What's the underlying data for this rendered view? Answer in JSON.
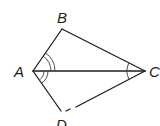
{
  "figure": {
    "type": "kite",
    "vertices": {
      "A": {
        "label": "A",
        "x": 33,
        "y": 71
      },
      "B": {
        "label": "B",
        "x": 62,
        "y": 29
      },
      "C": {
        "label": "C",
        "x": 145,
        "y": 71
      },
      "D": {
        "label": "D",
        "x": 61,
        "y": 111
      }
    },
    "segments": [
      "AB",
      "BC",
      "CD",
      "DA",
      "AC"
    ],
    "angle_marks": [
      {
        "vertex": "A",
        "between": "BA-AC",
        "arcs": 2
      },
      {
        "vertex": "A",
        "between": "CA-AD",
        "arcs": 2
      },
      {
        "vertex": "C",
        "between": "BC-CA",
        "arcs": 1
      },
      {
        "vertex": "C",
        "between": "AC-CD",
        "arcs": 1
      }
    ],
    "line_color": "#1e1e1e"
  },
  "labels": {
    "A": "A",
    "B": "B",
    "C": "C",
    "D": "D"
  }
}
